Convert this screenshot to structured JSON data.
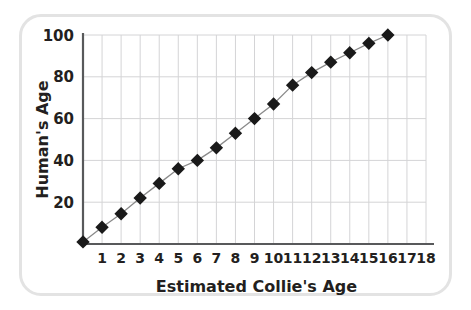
{
  "chart_data": {
    "type": "line",
    "title": "",
    "subtitle": "",
    "xlabel": "Estimated Collie's Age",
    "ylabel": "Human's Age",
    "xlim": [
      0,
      18
    ],
    "ylim": [
      0,
      100
    ],
    "grid": true,
    "legend": null,
    "legend_position": "none",
    "marker": "filled-diamond",
    "marker_color": "#1a1a1a",
    "line_color": "#8a8a8a",
    "grid_color": "#d4d4d6",
    "axis_color": "#58595b",
    "xticks": [
      1,
      2,
      3,
      4,
      5,
      6,
      7,
      8,
      9,
      10,
      11,
      12,
      13,
      14,
      15,
      16,
      17,
      18
    ],
    "xtick_labels": [
      "1",
      "2",
      "3",
      "4",
      "5",
      "6",
      "7",
      "8",
      "9",
      "10",
      "11",
      "12",
      "13",
      "14",
      "15",
      "16",
      "17",
      "18"
    ],
    "yticks": [
      20,
      40,
      60,
      80,
      100
    ],
    "ytick_labels": [
      "20",
      "40",
      "60",
      "80",
      "100"
    ],
    "x": [
      0,
      1,
      2,
      3,
      4,
      5,
      6,
      7,
      8,
      9,
      10,
      11,
      12,
      13,
      14,
      15,
      16
    ],
    "values": [
      1,
      8,
      14.5,
      22,
      29,
      36,
      40,
      46,
      53,
      60,
      67,
      76,
      82,
      87,
      91.5,
      96,
      100
    ],
    "points": [
      {
        "x": 0,
        "y": 1
      },
      {
        "x": 1,
        "y": 8
      },
      {
        "x": 2,
        "y": 14.5
      },
      {
        "x": 3,
        "y": 22
      },
      {
        "x": 4,
        "y": 29
      },
      {
        "x": 5,
        "y": 36
      },
      {
        "x": 6,
        "y": 40
      },
      {
        "x": 7,
        "y": 46
      },
      {
        "x": 8,
        "y": 53
      },
      {
        "x": 9,
        "y": 60
      },
      {
        "x": 10,
        "y": 67
      },
      {
        "x": 11,
        "y": 76
      },
      {
        "x": 12,
        "y": 82
      },
      {
        "x": 13,
        "y": 87
      },
      {
        "x": 14,
        "y": 91.5
      },
      {
        "x": 15,
        "y": 96
      },
      {
        "x": 16,
        "y": 100
      }
    ]
  }
}
